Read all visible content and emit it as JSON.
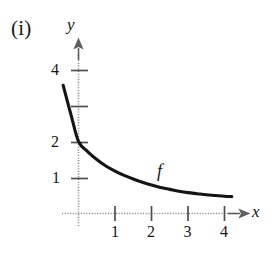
{
  "figure": {
    "part_label": "(i)",
    "background_color": "#ffffff",
    "curve_color": "#141414",
    "axis_color": "#7a7a7a",
    "text_color": "#161616"
  },
  "chart_data": {
    "type": "line",
    "title": "(i)",
    "subtitle": "",
    "xlabel": "x",
    "ylabel": "y",
    "xlim": [
      -0.8,
      5.2
    ],
    "ylim": [
      -0.6,
      4.8
    ],
    "grid": false,
    "legend": null,
    "x_ticks": [
      1,
      2,
      3,
      4
    ],
    "x_tick_labels": [
      "1",
      "2",
      "3",
      "4"
    ],
    "y_ticks": [
      1,
      2,
      3,
      4
    ],
    "y_tick_labels": [
      "1",
      "2",
      "",
      "4"
    ],
    "y_ticks_labeled": [
      1,
      2,
      4
    ],
    "annotations": [
      {
        "text": "f",
        "x": 2.05,
        "y": 1.12,
        "style": "italic"
      }
    ],
    "series": [
      {
        "name": "f",
        "description": "decreasing exponential decay curve passing through (0, 2)",
        "x": [
          -0.42,
          -0.2,
          0,
          0.25,
          0.5,
          0.75,
          1,
          1.25,
          1.5,
          1.75,
          2,
          2.25,
          2.5,
          2.75,
          3,
          3.25,
          3.5,
          3.75,
          4,
          4.2
        ],
        "y": [
          3.56,
          2.72,
          2.0,
          1.72,
          1.5,
          1.32,
          1.18,
          1.06,
          0.96,
          0.87,
          0.79,
          0.72,
          0.67,
          0.62,
          0.58,
          0.55,
          0.52,
          0.5,
          0.48,
          0.47
        ]
      }
    ]
  }
}
